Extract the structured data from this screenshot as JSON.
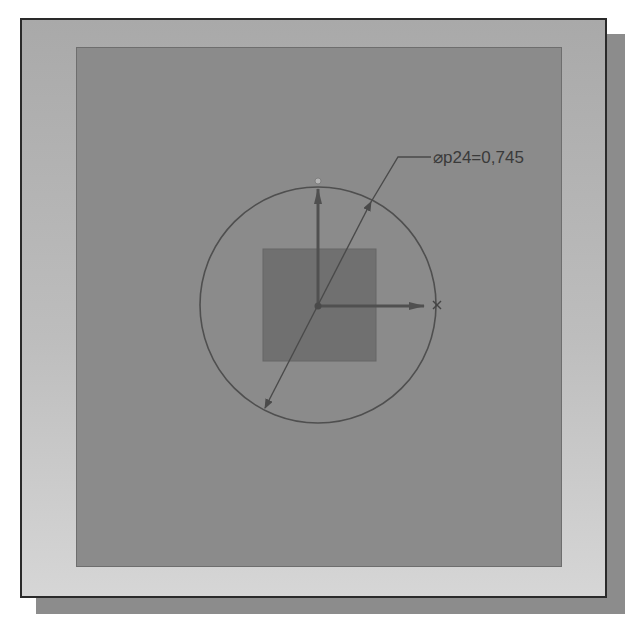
{
  "sketch": {
    "dimension_label": "⌀p24=0,745",
    "dimension_name": "p24",
    "dimension_value": "0,745",
    "dimension_type": "diameter"
  },
  "entities": {
    "circle": {
      "cx": 318,
      "cy": 305,
      "r": 118
    },
    "square": {
      "x": 263,
      "y": 249,
      "width": 113,
      "height": 112
    },
    "origin": {
      "x": 318,
      "y": 306
    },
    "axes": [
      "x-axis",
      "y-axis"
    ]
  },
  "colors": {
    "viewport_bg": "#8b8b8b",
    "frame_top": "#a9a9a9",
    "frame_bottom": "#d6d6d6",
    "square_fill": "#6f6f6f",
    "line": "#4a4a4a",
    "shadow": "#8c8c8c"
  }
}
